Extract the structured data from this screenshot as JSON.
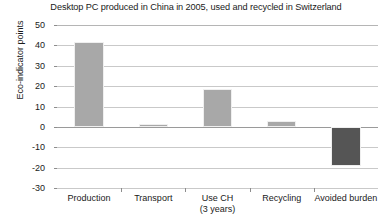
{
  "chart_data": {
    "type": "bar",
    "title": "Desktop PC produced in China in 2005, used and recycled in Switzerland",
    "xlabel": "",
    "ylabel": "Eco-indicator points",
    "categories": [
      "Production",
      "Transport",
      "Use CH",
      "Recycling",
      "Avoided burden"
    ],
    "category_sublabels": [
      "",
      "",
      "(3 years)",
      "",
      ""
    ],
    "values": [
      41.5,
      1.2,
      18.5,
      3.0,
      -19.0
    ],
    "bar_colors": [
      "#a8a8a8",
      "#a8a8a8",
      "#a8a8a8",
      "#a8a8a8",
      "#555555"
    ],
    "ylim": [
      -30,
      50
    ],
    "yticks": [
      50,
      40,
      30,
      20,
      10,
      0,
      -10,
      -20,
      -30
    ],
    "ytick_labels": [
      "50",
      "40",
      "30",
      "20",
      "10",
      "0",
      "-10",
      "-20",
      "-30"
    ],
    "grid": true,
    "legend": "none"
  },
  "colors": {
    "bar_light": "#a8a8a8",
    "bar_dark": "#555555",
    "gridline": "#c9c9c9",
    "zero_line": "#9a9a9a",
    "text": "#1a1a1a",
    "background": "#ffffff"
  }
}
